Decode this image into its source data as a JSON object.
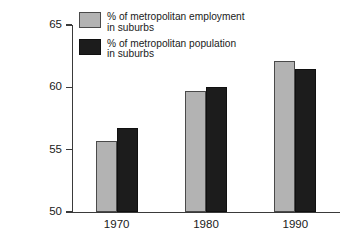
{
  "chart_data": {
    "type": "bar",
    "title": "",
    "xlabel": "",
    "ylabel": "Percent in suburbs",
    "categories": [
      "1970",
      "1980",
      "1990"
    ],
    "ylim": [
      50,
      65
    ],
    "yticks": [
      50,
      55,
      60,
      65
    ],
    "ytick_labels": [
      "50",
      "55",
      "60",
      "65"
    ],
    "grid": false,
    "legend_position": "top-left",
    "series": [
      {
        "name": "% of metropolitan employment\nin suburbs",
        "short_name": "employment",
        "color": "#b3b3b3",
        "values": [
          55.7,
          59.7,
          62.1
        ]
      },
      {
        "name": "% of metropolitan population\nin suburbs",
        "short_name": "population",
        "color": "#1c1c1c",
        "values": [
          56.7,
          60.0,
          61.5
        ]
      }
    ]
  },
  "axes": {
    "y_title": "Percent in suburbs",
    "y_tick_labels": [
      "65",
      "60",
      "55",
      "50"
    ],
    "x_tick_labels": [
      "1970",
      "1980",
      "1990"
    ]
  },
  "legend": {
    "entries": [
      {
        "label": "% of metropolitan employment\nin suburbs",
        "swatch": "gray-swatch"
      },
      {
        "label": "% of metropolitan population\nin suburbs",
        "swatch": "black-swatch"
      }
    ]
  }
}
